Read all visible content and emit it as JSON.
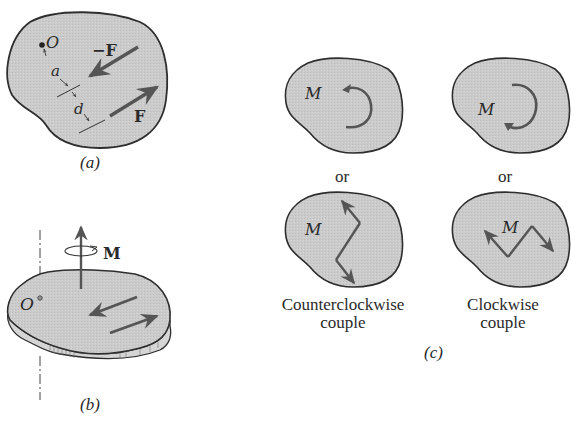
{
  "figure": {
    "colors": {
      "body_fill": "#c9c9c9",
      "outline": "#2e2e2e",
      "arrow": "#555555",
      "text": "#2a2a2a",
      "background": "#ffffff"
    },
    "panel_a": {
      "caption": "(a)",
      "point_label": "O",
      "force_neg_label": "−F",
      "force_label": "F",
      "dist_a_label": "a",
      "dist_d_label": "d"
    },
    "panel_b": {
      "caption": "(b)",
      "point_label": "O",
      "moment_label": "M"
    },
    "panel_c": {
      "caption": "(c)",
      "moment_label": "M",
      "or_label": "or",
      "ccw_label_line1": "Counterclockwise",
      "ccw_label_line2": "couple",
      "cw_label_line1": "Clockwise",
      "cw_label_line2": "couple"
    }
  }
}
